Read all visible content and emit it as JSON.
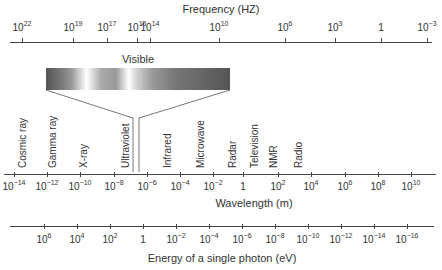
{
  "diagram": {
    "frequency_axis": {
      "title": "Frequency (HZ)",
      "ticks": [
        {
          "base": "10",
          "exp": "22",
          "x": 22
        },
        {
          "base": "10",
          "exp": "19",
          "x": 73
        },
        {
          "base": "10",
          "exp": "17",
          "x": 107
        },
        {
          "base": "10",
          "exp": "15",
          "x": 137
        },
        {
          "base": "10",
          "exp": "14",
          "x": 150
        },
        {
          "base": "10",
          "exp": "10",
          "x": 219
        },
        {
          "base": "10",
          "exp": "6",
          "x": 285
        },
        {
          "base": "10",
          "exp": "3",
          "x": 335
        },
        {
          "base": "1",
          "exp": "",
          "x": 381
        },
        {
          "base": "10",
          "exp": "−3",
          "x": 427
        }
      ]
    },
    "visible": {
      "label": "Visible"
    },
    "bands": [
      {
        "label": "Cosmic ray",
        "x": 18
      },
      {
        "label": "Gamma ray",
        "x": 48
      },
      {
        "label": "X-ray",
        "x": 79
      },
      {
        "label": "Ultraviolet",
        "x": 121
      },
      {
        "label": "Infrared",
        "x": 163
      },
      {
        "label": "Microwave",
        "x": 196
      },
      {
        "label": "Radar",
        "x": 228
      },
      {
        "label": "Television",
        "x": 250
      },
      {
        "label": "NMR",
        "x": 269
      },
      {
        "label": "Radio",
        "x": 294
      }
    ],
    "wavelength_axis": {
      "title": "Wavelength (m)",
      "ticks": [
        {
          "base": "10",
          "exp": "−14",
          "x": 14
        },
        {
          "base": "10",
          "exp": "−12",
          "x": 47
        },
        {
          "base": "10",
          "exp": "−10",
          "x": 80
        },
        {
          "base": "10",
          "exp": "−8",
          "x": 114
        },
        {
          "base": "10",
          "exp": "−6",
          "x": 147
        },
        {
          "base": "10",
          "exp": "−4",
          "x": 180
        },
        {
          "base": "10",
          "exp": "−2",
          "x": 213
        },
        {
          "base": "1",
          "exp": "",
          "x": 243
        },
        {
          "base": "10",
          "exp": "2",
          "x": 278
        },
        {
          "base": "10",
          "exp": "4",
          "x": 311
        },
        {
          "base": "10",
          "exp": "6",
          "x": 345
        },
        {
          "base": "10",
          "exp": "8",
          "x": 378
        },
        {
          "base": "10",
          "exp": "10",
          "x": 411
        }
      ]
    },
    "energy_axis": {
      "title": "Energy of a single photon (eV)",
      "ticks": [
        {
          "base": "10",
          "exp": "6",
          "x": 44
        },
        {
          "base": "10",
          "exp": "4",
          "x": 77
        },
        {
          "base": "10",
          "exp": "2",
          "x": 110
        },
        {
          "base": "1",
          "exp": "",
          "x": 143
        },
        {
          "base": "10",
          "exp": "−2",
          "x": 176
        },
        {
          "base": "10",
          "exp": "−4",
          "x": 209
        },
        {
          "base": "10",
          "exp": "−6",
          "x": 242
        },
        {
          "base": "10",
          "exp": "−8",
          "x": 275
        },
        {
          "base": "10",
          "exp": "−10",
          "x": 308
        },
        {
          "base": "10",
          "exp": "−12",
          "x": 341
        },
        {
          "base": "10",
          "exp": "−14",
          "x": 374
        },
        {
          "base": "10",
          "exp": "−16",
          "x": 407
        }
      ]
    }
  }
}
